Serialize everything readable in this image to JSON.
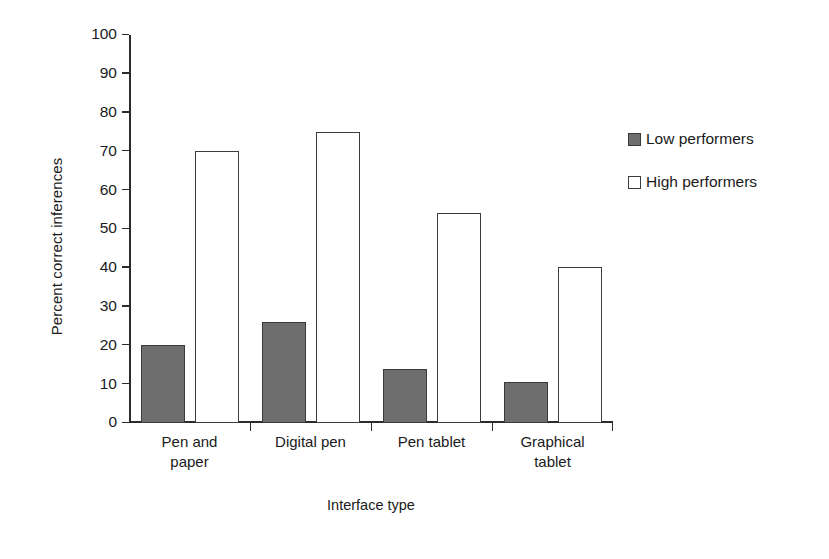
{
  "chart_data": {
    "type": "bar",
    "title": "",
    "subtitle": "",
    "xlabel": "Interface type",
    "ylabel": "Percent correct inferences",
    "categories": [
      "Pen and paper",
      "Digital pen",
      "Pen tablet",
      "Graphical tablet"
    ],
    "category_lines": [
      [
        "Pen and",
        "paper"
      ],
      [
        "Digital pen",
        ""
      ],
      [
        "Pen tablet",
        ""
      ],
      [
        "Graphical",
        "tablet"
      ]
    ],
    "series": [
      {
        "name": "Low performers",
        "values": [
          20,
          26,
          14,
          10.5
        ],
        "color": "#6e6e6e"
      },
      {
        "name": "High performers",
        "values": [
          70,
          75,
          54,
          40.3
        ],
        "color": "#ffffff"
      }
    ],
    "ylim": [
      0,
      100
    ],
    "ytick_step": 10,
    "yticks": [
      0,
      10,
      20,
      30,
      40,
      50,
      60,
      70,
      80,
      90,
      100
    ],
    "ytick_labels": [
      "0",
      "10",
      "20",
      "30",
      "40",
      "50",
      "60",
      "70",
      "80",
      "90",
      "100"
    ],
    "grid": false,
    "legend_position": "right",
    "bar_outline_color": "#3c3c3c"
  },
  "axes": {
    "y_title": "Percent correct inferences",
    "x_title": "Interface type"
  },
  "legend": {
    "entries": [
      {
        "label": "Low performers",
        "swatch": "low"
      },
      {
        "label": "High performers",
        "swatch": "high"
      }
    ]
  }
}
